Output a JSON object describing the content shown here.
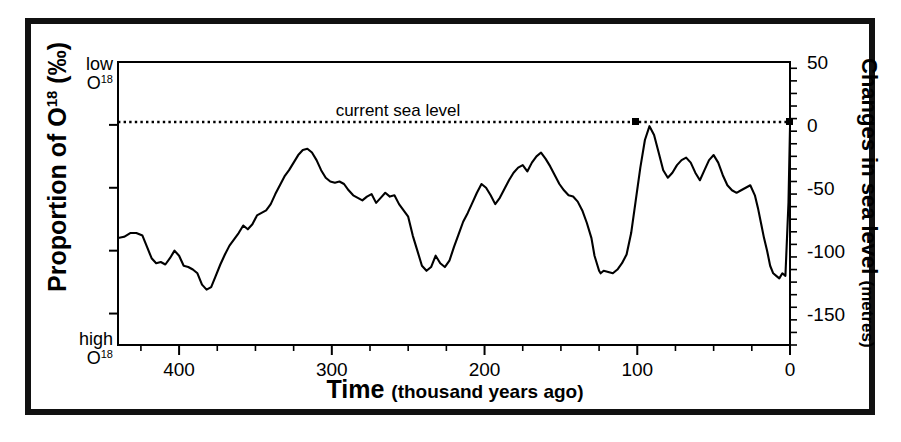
{
  "figure": {
    "border_color": "#111111",
    "background": "#ffffff"
  },
  "chart_data": {
    "type": "line",
    "title": "",
    "xlabel_main": "Time",
    "xlabel_small": "(thousand years ago)",
    "ylabel_left_main": "Proportion of O",
    "ylabel_left_sup": "18",
    "ylabel_left_unit": "(‰)",
    "ylabel_left_top": "low",
    "ylabel_left_top_sym": "O",
    "ylabel_left_top_sup": "18",
    "ylabel_left_bottom": "high",
    "ylabel_left_bottom_sym": "O",
    "ylabel_left_bottom_sup": "18",
    "ylabel_right_main": "Changes in sea level",
    "ylabel_right_small": "(metres)",
    "annotation": "current sea level",
    "xlim": [
      440,
      0
    ],
    "ylim": [
      -175,
      50
    ],
    "grid": false,
    "legend": null,
    "line_color": "#000000",
    "reference_line": {
      "value": 0,
      "style": "dotted",
      "label": "current sea level"
    },
    "xticks_major": [
      400,
      300,
      200,
      100,
      0
    ],
    "xticks_major_labels": [
      "400",
      "300",
      "200",
      "100",
      "0"
    ],
    "xticks_minor_step": 25,
    "yticks_major": [
      50,
      0,
      -50,
      -100,
      -150
    ],
    "yticks_major_labels": [
      "50",
      "0",
      "-50",
      "-100",
      "-150"
    ],
    "yticks_minor_step": 10,
    "series": [
      {
        "name": "sea level",
        "x": [
          440,
          436,
          432,
          428,
          424,
          421,
          418,
          415,
          412,
          409,
          406,
          403,
          400,
          397,
          394,
          391,
          388,
          385,
          382,
          379,
          376,
          373,
          370,
          367,
          364,
          361,
          358,
          355,
          352,
          349,
          346,
          343,
          340,
          337,
          334,
          331,
          328,
          325,
          322,
          319,
          316,
          313,
          310,
          307,
          304,
          301,
          298,
          295,
          292,
          289,
          286,
          283,
          280,
          277,
          274,
          271,
          268,
          265,
          262,
          259,
          256,
          253,
          250,
          247,
          244,
          241,
          238,
          235,
          232,
          229,
          226,
          223,
          220,
          217,
          214,
          211,
          208,
          205,
          202,
          199,
          196,
          193,
          190,
          187,
          184,
          181,
          178,
          175,
          172,
          169,
          166,
          163,
          160,
          157,
          154,
          151,
          148,
          145,
          142,
          139,
          136,
          133,
          130,
          128,
          126,
          125,
          124,
          122,
          119,
          116,
          113,
          110,
          107,
          104,
          101,
          98,
          95,
          92,
          89,
          86,
          83,
          80,
          77,
          74,
          71,
          68,
          65,
          62,
          59,
          56,
          53,
          50,
          47,
          44,
          41,
          38,
          35,
          32,
          29,
          26,
          23,
          21,
          19,
          17,
          15,
          13,
          11,
          9,
          7,
          5,
          3,
          1,
          0
        ],
        "y": [
          -90,
          -89,
          -86,
          -86,
          -88,
          -97,
          -106,
          -110,
          -109,
          -111,
          -106,
          -100,
          -104,
          -112,
          -113,
          -115,
          -118,
          -127,
          -131,
          -129,
          -120,
          -111,
          -103,
          -96,
          -91,
          -86,
          -80,
          -83,
          -79,
          -72,
          -70,
          -68,
          -63,
          -55,
          -48,
          -41,
          -36,
          -30,
          -24,
          -20,
          -19,
          -22,
          -28,
          -36,
          -42,
          -45,
          -46,
          -45,
          -47,
          -52,
          -56,
          -58,
          -60,
          -57,
          -55,
          -62,
          -58,
          -54,
          -57,
          -56,
          -63,
          -68,
          -73,
          -88,
          -100,
          -112,
          -116,
          -113,
          -104,
          -110,
          -113,
          -108,
          -97,
          -87,
          -77,
          -70,
          -62,
          -54,
          -47,
          -50,
          -56,
          -63,
          -58,
          -51,
          -44,
          -38,
          -34,
          -32,
          -37,
          -30,
          -25,
          -22,
          -27,
          -33,
          -40,
          -47,
          -52,
          -56,
          -57,
          -61,
          -68,
          -78,
          -90,
          -104,
          -112,
          -116,
          -118,
          -116,
          -117,
          -118,
          -115,
          -110,
          -103,
          -86,
          -60,
          -34,
          -12,
          -1,
          -8,
          -22,
          -36,
          -42,
          -38,
          -32,
          -28,
          -26,
          -30,
          -38,
          -44,
          -36,
          -28,
          -24,
          -30,
          -40,
          -48,
          -52,
          -54,
          -52,
          -50,
          -48,
          -56,
          -66,
          -78,
          -90,
          -100,
          -112,
          -118,
          -120,
          -122,
          -118,
          -120,
          -62,
          -2
        ]
      }
    ]
  }
}
